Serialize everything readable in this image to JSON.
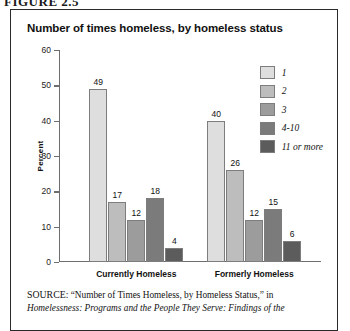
{
  "figure_label": "FIGURE 2.5",
  "chart_title": "Number of times homeless, by homeless status",
  "legend": {
    "items": [
      {
        "label": "1",
        "color": "#dedede"
      },
      {
        "label": "2",
        "color": "#bdbdbd"
      },
      {
        "label": "3",
        "color": "#9c9c9c"
      },
      {
        "label": "4-10",
        "color": "#7b7b7b"
      },
      {
        "label": "11 or more",
        "color": "#5c5c5c"
      }
    ]
  },
  "source": {
    "prefix": "SOURCE:",
    "quoted": "“Number of Times Homeless, by Homeless Status,” in",
    "italic_line": "Homelessness: Programs and the People They Serve: Findings of the"
  },
  "chart_data": {
    "type": "bar",
    "title": "Number of times homeless, by homeless status",
    "xlabel": "",
    "ylabel": "Percent",
    "ylim": [
      0,
      60
    ],
    "yticks": [
      0,
      10,
      20,
      30,
      40,
      50,
      60
    ],
    "grid": false,
    "legend_position": "top-right",
    "categories": [
      "Currently Homeless",
      "Formerly Homeless"
    ],
    "series": [
      {
        "name": "1",
        "color": "#dedede",
        "values": [
          49,
          40
        ]
      },
      {
        "name": "2",
        "color": "#bdbdbd",
        "values": [
          17,
          26
        ]
      },
      {
        "name": "3",
        "color": "#9c9c9c",
        "values": [
          12,
          12
        ]
      },
      {
        "name": "4-10",
        "color": "#7b7b7b",
        "values": [
          18,
          15
        ]
      },
      {
        "name": "11 or more",
        "color": "#5c5c5c",
        "values": [
          4,
          6
        ]
      }
    ]
  }
}
